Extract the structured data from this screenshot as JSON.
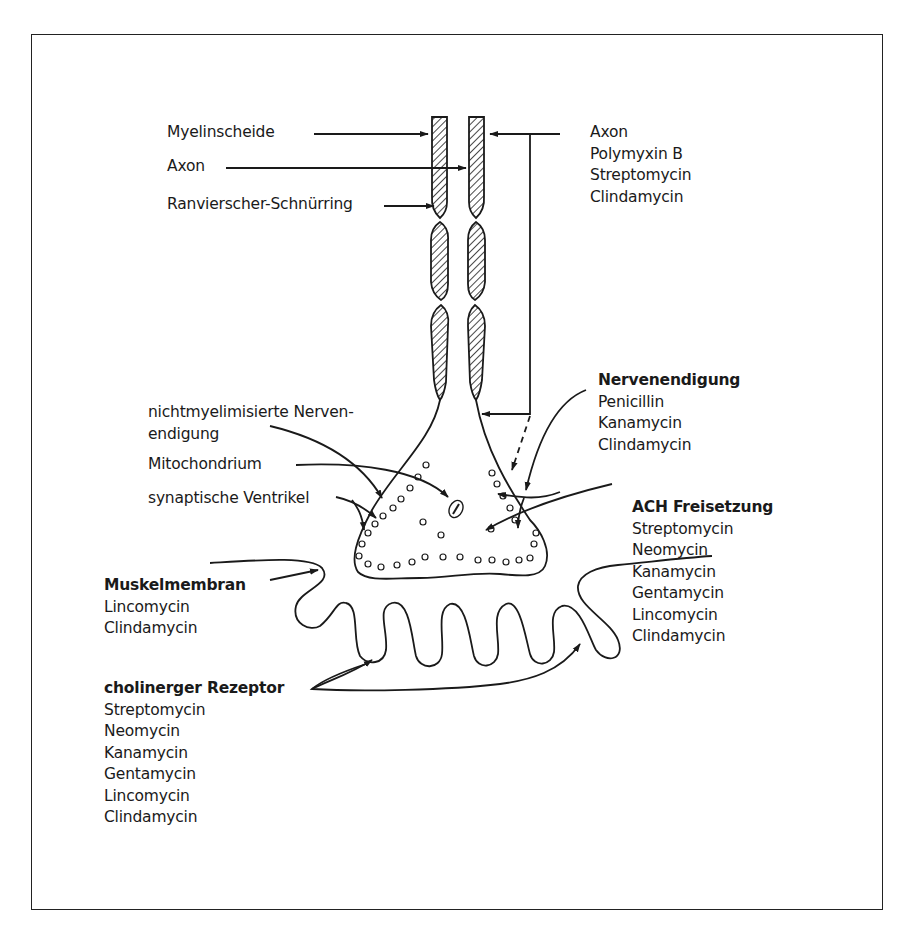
{
  "diagram": {
    "labels_left": {
      "myelinscheide": "Myelinscheide",
      "axon": "Axon",
      "ranvier": "Ranvierscher-Schnürring",
      "nicht_line1": "nichtmyelimisierte Nerven-",
      "nicht_line2": "endigung",
      "mitochondrium": "Mitochondrium",
      "synaptische": "synaptische Ventrikel"
    },
    "groups": {
      "axon": {
        "heading": "Axon",
        "heading_bold": false,
        "items": [
          "Polymyxin B",
          "Streptomycin",
          "Clindamycin"
        ]
      },
      "nervenendigung": {
        "heading": "Nervenendigung",
        "heading_bold": true,
        "items": [
          "Penicillin",
          "Kanamycin",
          "Clindamycin"
        ]
      },
      "ach": {
        "heading": "ACH Freisetzung",
        "heading_bold": true,
        "items": [
          "Streptomycin",
          "Neomycin",
          "Kanamycin",
          "Gentamycin",
          "Lincomycin",
          "Clindamycin"
        ]
      },
      "muskel": {
        "heading": "Muskelmembran",
        "heading_bold": true,
        "items": [
          "Lincomycin",
          "Clindamycin"
        ]
      },
      "rezeptor": {
        "heading": "cholinerger Rezeptor",
        "heading_bold": true,
        "items": [
          "Streptomycin",
          "Neomycin",
          "Kanamycin",
          "Gentamycin",
          "Lincomycin",
          "Clindamycin"
        ]
      }
    },
    "colors": {
      "ink": "#1a1a1a",
      "frame": "#222222",
      "background": "#ffffff"
    }
  }
}
